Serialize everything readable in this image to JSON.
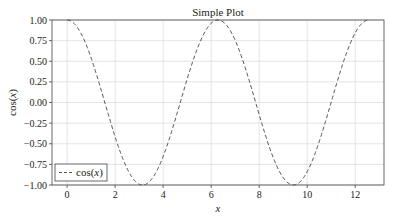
{
  "chart_data": {
    "type": "line",
    "title": "Simple Plot",
    "xlabel": "x",
    "ylabel": "cos(x)",
    "xlim": [
      -0.63,
      13.2
    ],
    "ylim": [
      -1.0,
      1.0
    ],
    "x_ticks": [
      0,
      2,
      4,
      6,
      8,
      10,
      12
    ],
    "y_ticks": [
      1.0,
      0.75,
      0.5,
      0.25,
      0.0,
      -0.25,
      -0.5,
      -0.75,
      -1.0
    ],
    "y_tick_labels": [
      "1.00",
      "0.75",
      "0.50",
      "0.25",
      "0.00",
      "−0.25",
      "−0.50",
      "−0.75",
      "−1.00"
    ],
    "grid": true,
    "legend": {
      "position": "lower left",
      "entries": [
        "cos(x)"
      ]
    },
    "series": [
      {
        "name": "cos(x)",
        "function": "cos(x)",
        "x_range": [
          0,
          12.566
        ],
        "style": "dashed",
        "color": "#444444",
        "x": [
          0,
          1.5708,
          3.1416,
          4.7124,
          6.2832,
          7.854,
          9.4248,
          10.9956,
          12.5664
        ],
        "values": [
          1.0,
          0.0,
          -1.0,
          0.0,
          1.0,
          0.0,
          -1.0,
          0.0,
          1.0
        ]
      }
    ]
  },
  "plot": {
    "title": "Simple Plot",
    "xlabel": "x",
    "ylabel_prefix": "cos(",
    "ylabel_var": "x",
    "ylabel_suffix": ")",
    "legend_label_prefix": "cos(",
    "legend_label_var": "x",
    "legend_label_suffix": ")"
  }
}
